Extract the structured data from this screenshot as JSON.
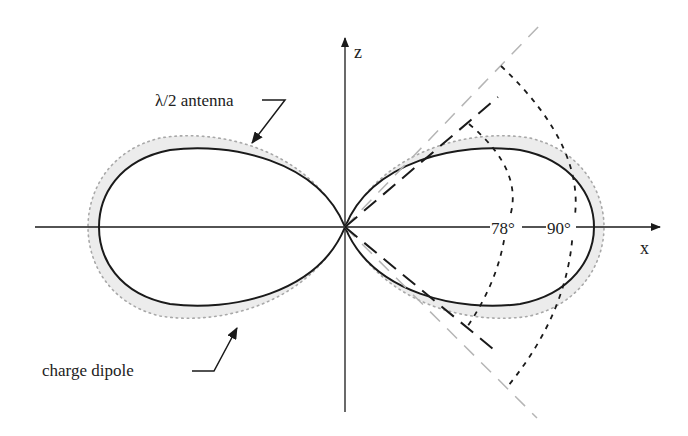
{
  "diagram": {
    "title": "",
    "axes": {
      "x_label": "x",
      "z_label": "z"
    },
    "labels": {
      "antenna": "λ/2 antenna",
      "dipole": "charge dipole",
      "angle_inner": "78°",
      "angle_outer": "90°"
    },
    "colors": {
      "line": "#1a1a1a",
      "gray_dash": "#b5b5b5",
      "dipole_fill": "#e6e6e6",
      "dipole_dots": "#a8a8a8"
    }
  }
}
